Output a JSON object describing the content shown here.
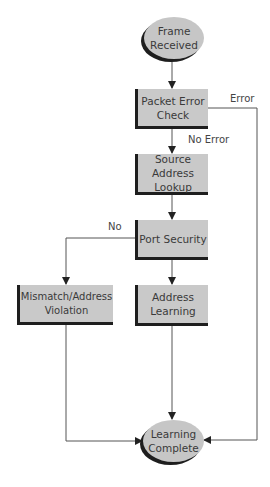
{
  "diagram": {
    "type": "flowchart",
    "colors": {
      "fill": "#c9c9c9",
      "shadow": "#1e1e1e",
      "line": "#555555",
      "text": "#3a3a3a"
    },
    "nodes": {
      "frame_received": {
        "shape": "ellipse",
        "label": "Frame\nReceived"
      },
      "packet_error_check": {
        "shape": "box",
        "label": "Packet Error\nCheck"
      },
      "source_address_lookup": {
        "shape": "box",
        "label": "Source Address\nLookup"
      },
      "port_security": {
        "shape": "box",
        "label": "Port Security"
      },
      "address_learning": {
        "shape": "box",
        "label": "Address\nLearning"
      },
      "mismatch_violation": {
        "shape": "box",
        "label": "Mismatch/Address\nViolation"
      },
      "learning_complete": {
        "shape": "ellipse",
        "label": "Learning\nComplete"
      }
    },
    "edge_labels": {
      "error": "Error",
      "no_error": "No Error",
      "no": "No"
    },
    "edges": [
      {
        "from": "Frame Received",
        "to": "Packet Error Check",
        "label": ""
      },
      {
        "from": "Packet Error Check",
        "to": "Source Address Lookup",
        "label": "No Error"
      },
      {
        "from": "Packet Error Check",
        "to": "Learning Complete",
        "label": "Error"
      },
      {
        "from": "Source Address Lookup",
        "to": "Port Security",
        "label": ""
      },
      {
        "from": "Port Security",
        "to": "Address Learning",
        "label": ""
      },
      {
        "from": "Port Security",
        "to": "Mismatch/Address Violation",
        "label": "No"
      },
      {
        "from": "Address Learning",
        "to": "Learning Complete",
        "label": ""
      },
      {
        "from": "Mismatch/Address Violation",
        "to": "Learning Complete",
        "label": ""
      }
    ]
  }
}
